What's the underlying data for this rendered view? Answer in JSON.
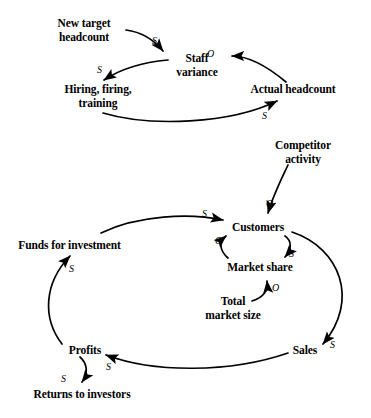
{
  "diagram": {
    "type": "causal-loop-diagram",
    "background_color": "#ffffff",
    "stroke_color": "#000000",
    "nodes": [
      {
        "id": "new-target-headcount",
        "label": "New target\nheadcount",
        "x": 43,
        "y": 17,
        "width": 82
      },
      {
        "id": "staff-variance",
        "label": "Staff\nvariance",
        "x": 166,
        "y": 52,
        "width": 62
      },
      {
        "id": "hiring-firing-training",
        "label": "Hiring, firing,\ntraining",
        "x": 38,
        "y": 83,
        "width": 120
      },
      {
        "id": "actual-headcount",
        "label": "Actual headcount",
        "x": 245,
        "y": 83,
        "width": 96
      },
      {
        "id": "competitor-activity",
        "label": "Competitor\nactivity",
        "x": 261,
        "y": 139,
        "width": 84
      },
      {
        "id": "funds-for-investment",
        "label": "Funds for investment",
        "x": 12,
        "y": 239,
        "width": 115
      },
      {
        "id": "customers",
        "label": "Customers",
        "x": 226,
        "y": 221,
        "width": 64
      },
      {
        "id": "market-share",
        "label": "Market share",
        "x": 222,
        "y": 261,
        "width": 76
      },
      {
        "id": "total-market-size",
        "label": "Total\nmarket size",
        "x": 191,
        "y": 295,
        "width": 84
      },
      {
        "id": "profits",
        "label": "Profits",
        "x": 64,
        "y": 344,
        "width": 42
      },
      {
        "id": "sales",
        "label": "Sales",
        "x": 286,
        "y": 344,
        "width": 38
      },
      {
        "id": "returns-to-investors",
        "label": "Returns to investors",
        "x": 28,
        "y": 388,
        "width": 108
      }
    ],
    "links": [
      {
        "id": "new-target-to-staff-variance",
        "from": "new-target-headcount",
        "to": "staff-variance",
        "polarity": "S",
        "polarity_x": 152,
        "polarity_y": 36
      },
      {
        "id": "staff-variance-to-hiring",
        "from": "staff-variance",
        "to": "hiring-firing-training",
        "polarity": "S",
        "polarity_x": 97,
        "polarity_y": 65
      },
      {
        "id": "hiring-to-actual-headcount",
        "from": "hiring-firing-training",
        "to": "actual-headcount",
        "polarity": "S",
        "polarity_x": 262,
        "polarity_y": 111
      },
      {
        "id": "actual-headcount-to-staff-variance",
        "from": "actual-headcount",
        "to": "staff-variance",
        "polarity": "O",
        "polarity_x": 207,
        "polarity_y": 49
      },
      {
        "id": "competitor-activity-to-customers",
        "from": "competitor-activity",
        "to": "customers",
        "polarity": "O",
        "polarity_x": 266,
        "polarity_y": 199
      },
      {
        "id": "funds-to-customers",
        "from": "funds-for-investment",
        "to": "customers",
        "polarity": "S",
        "polarity_x": 202,
        "polarity_y": 209
      },
      {
        "id": "customers-to-market-share",
        "from": "customers",
        "to": "market-share",
        "polarity": "S",
        "polarity_x": 282,
        "polarity_y": 250
      },
      {
        "id": "market-share-to-customers",
        "from": "market-share",
        "to": "customers",
        "polarity": "O",
        "polarity_x": 215,
        "polarity_y": 236
      },
      {
        "id": "total-market-size-to-market-share",
        "from": "total-market-size",
        "to": "market-share",
        "polarity": "O",
        "polarity_x": 272,
        "polarity_y": 283
      },
      {
        "id": "customers-to-sales",
        "from": "customers",
        "to": "sales",
        "polarity": "S",
        "polarity_x": 330,
        "polarity_y": 340
      },
      {
        "id": "sales-to-profits",
        "from": "sales",
        "to": "profits",
        "polarity": "S",
        "polarity_x": 106,
        "polarity_y": 362
      },
      {
        "id": "profits-to-funds",
        "from": "profits",
        "to": "funds-for-investment",
        "polarity": "S",
        "polarity_x": 69,
        "polarity_y": 264
      },
      {
        "id": "profits-to-returns",
        "from": "profits",
        "to": "returns-to-investors",
        "polarity": "S",
        "polarity_x": 61,
        "polarity_y": 374
      }
    ]
  }
}
